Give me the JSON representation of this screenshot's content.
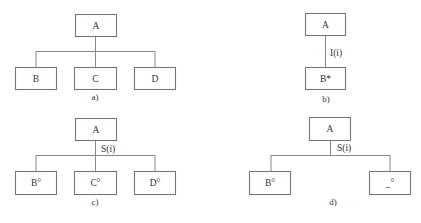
{
  "diagrams": {
    "a": {
      "caption": "a)",
      "root": "A",
      "children": [
        "B",
        "C",
        "D"
      ]
    },
    "b": {
      "caption": "b)",
      "root": "A",
      "edge_label": "I(i)",
      "children": [
        "B*"
      ]
    },
    "c": {
      "caption": "c)",
      "root": "A",
      "edge_label": "S(i)",
      "children": [
        "B°",
        "C°",
        "D°"
      ]
    },
    "d": {
      "caption": "d)",
      "root": "A",
      "edge_label": "S(i)",
      "children": [
        "B°",
        "_°"
      ]
    }
  },
  "colors": {
    "stroke": "#777777",
    "text": "#333333",
    "background": "#ffffff"
  }
}
